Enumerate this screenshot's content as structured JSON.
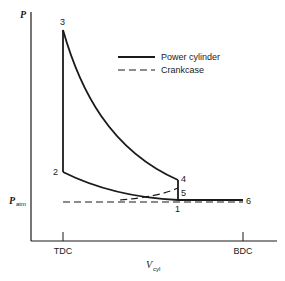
{
  "axes": {
    "y_label": "P",
    "x_label": "V",
    "x_label_sub": "cyl",
    "patm_label": "P",
    "patm_sub": "atm",
    "x_ticks": [
      "TDC",
      "BDC"
    ]
  },
  "legend": {
    "items": [
      {
        "label": "Power cylinder",
        "style": "solid"
      },
      {
        "label": "Crankcase",
        "style": "dashed"
      }
    ]
  },
  "points": {
    "p1": "1",
    "p2": "2",
    "p3": "3",
    "p4": "4",
    "p5": "5",
    "p6": "6"
  },
  "colors": {
    "ink": "#1a1a1a",
    "background": "#ffffff"
  }
}
